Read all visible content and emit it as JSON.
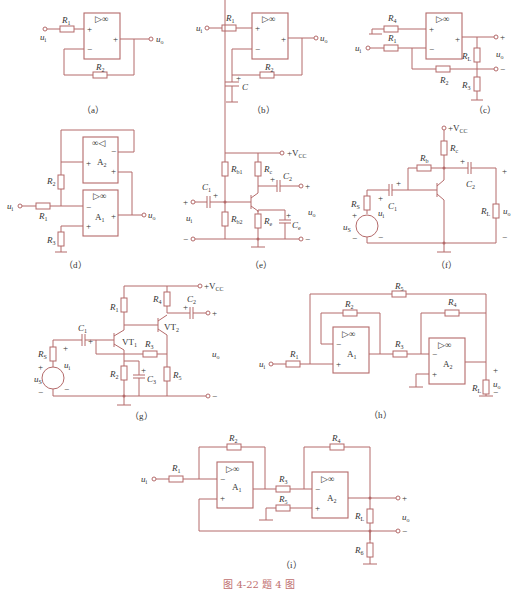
{
  "figure": {
    "caption": "图 4-22   题 4 图",
    "accent_color": "#b46a6a",
    "panels": [
      {
        "id": "a",
        "label": "（a）",
        "components": [
          "R1",
          "R2",
          "op-amp ▷∞"
        ],
        "terminals": [
          "ui",
          "uo"
        ]
      },
      {
        "id": "b",
        "label": "（b）",
        "components": [
          "R1",
          "R2",
          "C",
          "op-amp ▷∞"
        ],
        "terminals": [
          "ui",
          "uo"
        ]
      },
      {
        "id": "c",
        "label": "（c）",
        "components": [
          "R4",
          "R1",
          "R2",
          "RL",
          "R3",
          "op-amp ▷∞"
        ],
        "terminals": [
          "ui",
          "uo",
          "+",
          "−"
        ]
      },
      {
        "id": "d",
        "label": "（d）",
        "components": [
          "R2",
          "R1",
          "R3",
          "A1",
          "A2"
        ],
        "terminals": [
          "ui",
          "uo"
        ]
      },
      {
        "id": "e",
        "label": "（e）",
        "components": [
          "Rb1",
          "Rb2",
          "Rc",
          "Re",
          "C1",
          "C2",
          "Ce",
          "+VCC"
        ],
        "terminals": [
          "ui",
          "uo",
          "+",
          "−"
        ]
      },
      {
        "id": "f",
        "label": "（f）",
        "components": [
          "Rc",
          "Rb",
          "C1",
          "C2",
          "RS",
          "RL",
          "us",
          "+VCC"
        ],
        "terminals": [
          "ui",
          "uo",
          "+",
          "−"
        ]
      },
      {
        "id": "g",
        "label": "（g）",
        "components": [
          "R1",
          "R2",
          "R3",
          "R4",
          "R5",
          "RS",
          "C1",
          "C2",
          "C3",
          "VT1",
          "VT2",
          "+VCC"
        ],
        "terminals": [
          "ui",
          "us",
          "uo",
          "+",
          "−"
        ]
      },
      {
        "id": "h",
        "label": "（h）",
        "components": [
          "R1",
          "R2",
          "R3",
          "R4",
          "R5",
          "RL",
          "A1",
          "A2"
        ],
        "terminals": [
          "ui",
          "uo"
        ]
      },
      {
        "id": "i",
        "label": "（i）",
        "components": [
          "R1",
          "R2",
          "R3",
          "R4",
          "R5",
          "RL",
          "R6",
          "A1",
          "A2"
        ],
        "terminals": [
          "ui",
          "uo",
          "+",
          "−"
        ]
      }
    ]
  },
  "labels": {
    "a": {
      "r1": "R",
      "r1s": "1",
      "r2": "R",
      "r2s": "2",
      "ui": "u",
      "uis": "i",
      "uo": "u",
      "uos": "o",
      "opamp": "▷∞",
      "plus": "+",
      "minus": "−",
      "cap": "（a）"
    },
    "b": {
      "r1": "R",
      "r1s": "1",
      "r2": "R",
      "r2s": "2",
      "c": "C",
      "ui": "u",
      "uis": "i",
      "uo": "u",
      "uos": "o",
      "opamp": "▷∞",
      "plus": "+",
      "minus": "−",
      "cap": "（b）"
    },
    "c": {
      "r4": "R",
      "r4s": "4",
      "r1": "R",
      "r1s": "1",
      "r2": "R",
      "r2s": "2",
      "rl": "R",
      "rls": "L",
      "r3": "R",
      "r3s": "3",
      "ui": "u",
      "uis": "i",
      "uo": "u",
      "uos": "o",
      "opamp": "▷∞",
      "plus": "+",
      "minus": "−",
      "cap": "（c）"
    },
    "d": {
      "r2": "R",
      "r2s": "2",
      "r1": "R",
      "r1s": "1",
      "r3": "R",
      "r3s": "3",
      "a1": "A",
      "a1s": "1",
      "a2": "A",
      "a2s": "2",
      "ui": "u",
      "uis": "i",
      "uo": "u",
      "uos": "o",
      "op1": "▷∞",
      "op2": "∞◁",
      "plus": "+",
      "minus": "−",
      "cap": "（d）"
    },
    "e": {
      "rb1": "R",
      "rb1s": "b1",
      "rb2": "R",
      "rb2s": "b2",
      "rc": "R",
      "rcs": "c",
      "re": "R",
      "res": "e",
      "c1": "C",
      "c1s": "1",
      "c2": "C",
      "c2s": "2",
      "ce": "C",
      "ces": "e",
      "vcc": "+V",
      "vccs": "CC",
      "ui": "u",
      "uis": "i",
      "uo": "u",
      "uos": "o",
      "plus": "+",
      "minus": "−",
      "cap": "（e）"
    },
    "f": {
      "rc": "R",
      "rcs": "c",
      "rb": "R",
      "rbs": "b",
      "c1": "C",
      "c1s": "1",
      "c2": "C",
      "c2s": "2",
      "rs": "R",
      "rss": "S",
      "rl": "R",
      "rls": "L",
      "us": "u",
      "uss": "S",
      "ui": "u",
      "uis": "i",
      "uo": "u",
      "uos": "o",
      "vcc": "+V",
      "vccs": "CC",
      "plus": "+",
      "minus": "−",
      "cap": "（f）"
    },
    "g": {
      "r1": "R",
      "r1s": "1",
      "r2": "R",
      "r2s": "2",
      "r3": "R",
      "r3s": "3",
      "r4": "R",
      "r4s": "4",
      "r5": "R",
      "r5s": "5",
      "rs": "R",
      "rss": "S",
      "c1": "C",
      "c1s": "1",
      "c2": "C",
      "c2s": "2",
      "c3": "C",
      "c3s": "3",
      "vt1": "VT",
      "vt1s": "1",
      "vt2": "VT",
      "vt2s": "2",
      "vcc": "+V",
      "vccs": "CC",
      "us": "u",
      "uss": "S",
      "ui": "u",
      "uis": "i",
      "uo": "u",
      "uos": "o",
      "plus": "+",
      "minus": "−",
      "cap": "（g）"
    },
    "h": {
      "r1": "R",
      "r1s": "1",
      "r2": "R",
      "r2s": "2",
      "r3": "R",
      "r3s": "3",
      "r4": "R",
      "r4s": "4",
      "r5": "R",
      "r5s": "5",
      "rl": "R",
      "rls": "L",
      "a1": "A",
      "a1s": "1",
      "a2": "A",
      "a2s": "2",
      "ui": "u",
      "uis": "i",
      "uo": "u",
      "uos": "o",
      "opamp": "▷∞",
      "plus": "+",
      "minus": "−",
      "cap": "（h）"
    },
    "i": {
      "r1": "R",
      "r1s": "1",
      "r2": "R",
      "r2s": "2",
      "r3": "R",
      "r3s": "3",
      "r4": "R",
      "r4s": "4",
      "r5": "R",
      "r5s": "5",
      "rl": "R",
      "rls": "L",
      "r6": "R",
      "r6s": "6",
      "a1": "A",
      "a1s": "1",
      "a2": "A",
      "a2s": "2",
      "ui": "u",
      "uis": "i",
      "uo": "u",
      "uos": "o",
      "opamp": "▷∞",
      "plus": "+",
      "minus": "−",
      "cap": "（i）"
    }
  }
}
